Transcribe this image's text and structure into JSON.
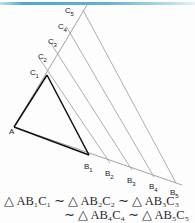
{
  "figure": {
    "stroke_dark": "#111111",
    "stroke_light": "#8d8d8d",
    "accent_rule": "#4fa8cc",
    "points": {
      "A": {
        "x": 14,
        "y": 127,
        "label": "A"
      },
      "B1": {
        "x": 89,
        "y": 155,
        "label": "B"
      },
      "B2": {
        "x": 110,
        "y": 163,
        "label": "B"
      },
      "B3": {
        "x": 132,
        "y": 170,
        "label": "B"
      },
      "B4": {
        "x": 154,
        "y": 177,
        "label": "B"
      },
      "B5": {
        "x": 176,
        "y": 183,
        "label": "B"
      },
      "C1": {
        "x": 47,
        "y": 75,
        "label": "C"
      },
      "C2": {
        "x": 39,
        "y": 58,
        "label": "C"
      },
      "C3": {
        "x": 57,
        "y": 44,
        "label": "C"
      },
      "C4": {
        "x": 68,
        "y": 28,
        "label": "C"
      },
      "C5": {
        "x": 83,
        "y": 10,
        "label": "C"
      }
    },
    "labels": [
      {
        "name": "point-label-a",
        "base": "A",
        "sub": "",
        "x": 9,
        "y": 134
      },
      {
        "name": "point-label-b1",
        "base": "B",
        "sub": "1",
        "x": 84,
        "y": 170
      },
      {
        "name": "point-label-b2",
        "base": "B",
        "sub": "2",
        "x": 105,
        "y": 177
      },
      {
        "name": "point-label-b3",
        "base": "B",
        "sub": "3",
        "x": 127,
        "y": 184
      },
      {
        "name": "point-label-b4",
        "base": "B",
        "sub": "4",
        "x": 149,
        "y": 190
      },
      {
        "name": "point-label-b5",
        "base": "B",
        "sub": "5",
        "x": 170,
        "y": 196
      },
      {
        "name": "point-label-c1",
        "base": "C",
        "sub": "1",
        "x": 30,
        "y": 74
      },
      {
        "name": "point-label-c2",
        "base": "C",
        "sub": "2",
        "x": 39,
        "y": 58
      },
      {
        "name": "point-label-c3",
        "base": "C",
        "sub": "3",
        "x": 49,
        "y": 44
      },
      {
        "name": "point-label-c4",
        "base": "C",
        "sub": "4",
        "x": 59,
        "y": 29
      },
      {
        "name": "point-label-c5",
        "base": "C",
        "sub": "5",
        "x": 65,
        "y": 13
      }
    ]
  },
  "caption": {
    "line1": "△ AB₁C₁ ∼ △ AB₂C₂ ∼ △ AB₃C₃",
    "line2": "∼ △ AB₄C₄ ∼ △ AB₅C₅"
  }
}
